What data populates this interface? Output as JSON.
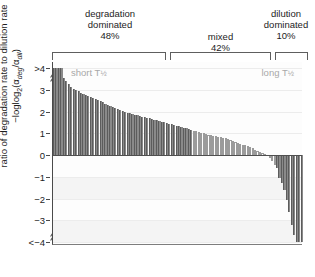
{
  "figure": {
    "categories": [
      {
        "line1": "degradation",
        "line2": "dominated",
        "percent": "48%"
      },
      {
        "line1": "mixed",
        "line2": "",
        "percent": "42%"
      },
      {
        "line1": "dilution",
        "line2": "dominated",
        "percent": "10%"
      }
    ],
    "annotations": {
      "left": "short T",
      "left_sub": "½",
      "right": "long T",
      "right_sub": "½"
    },
    "axis_title": {
      "line1": "ratio of degradation rate to dilution rate",
      "line2_prefix": "−log",
      "line2_base": "2",
      "line2_expr_open": "(α",
      "line2_sub1": "deg",
      "line2_slash": "/α",
      "line2_sub2": "dil",
      "line2_close": ")"
    },
    "ticks": [
      ">4",
      "3",
      "2",
      "1",
      "0",
      "−1",
      "−2",
      "−3",
      "<−4"
    ]
  },
  "chart_data": {
    "type": "bar",
    "title": "ratio of degradation rate to dilution rate",
    "xlabel": "",
    "ylabel": "−log2(αdeg/αdil)",
    "ylim": [
      -4,
      4
    ],
    "grid": true,
    "legend": "none",
    "group_labels": [
      "degradation dominated 48%",
      "mixed 42%",
      "dilution dominated 10%"
    ],
    "group_fractions": [
      48,
      42,
      10
    ],
    "group_boundaries_index": [
      0,
      57,
      91,
      100
    ],
    "note": "rank-ordered waterfall of per-protein -log2(alpha_deg/alpha_dil); values clipped at +4 and -4",
    "values": [
      4.0,
      4.0,
      4.0,
      4.0,
      3.55,
      3.38,
      3.25,
      3.14,
      3.05,
      2.98,
      2.92,
      2.86,
      2.81,
      2.76,
      2.71,
      2.66,
      2.62,
      2.57,
      2.52,
      2.47,
      2.42,
      2.36,
      2.3,
      2.24,
      2.19,
      2.14,
      2.1,
      2.06,
      2.02,
      1.98,
      1.95,
      1.92,
      1.89,
      1.86,
      1.83,
      1.8,
      1.77,
      1.74,
      1.71,
      1.68,
      1.65,
      1.62,
      1.59,
      1.56,
      1.53,
      1.5,
      1.47,
      1.44,
      1.41,
      1.38,
      1.35,
      1.32,
      1.29,
      1.26,
      1.23,
      1.2,
      1.17,
      1.12,
      1.09,
      1.06,
      1.03,
      1.0,
      0.97,
      0.94,
      0.91,
      0.88,
      0.86,
      0.84,
      0.82,
      0.8,
      0.76,
      0.72,
      0.68,
      0.64,
      0.6,
      0.56,
      0.52,
      0.48,
      0.44,
      0.4,
      0.35,
      0.3,
      0.25,
      0.2,
      0.15,
      0.1,
      0.05,
      -0.05,
      -0.15,
      -0.28,
      -0.45,
      -0.62,
      -1.05,
      -1.3,
      -1.62,
      -2.05,
      -2.6,
      -3.2,
      -3.7,
      -4.0,
      -4.0,
      -4.0
    ]
  }
}
